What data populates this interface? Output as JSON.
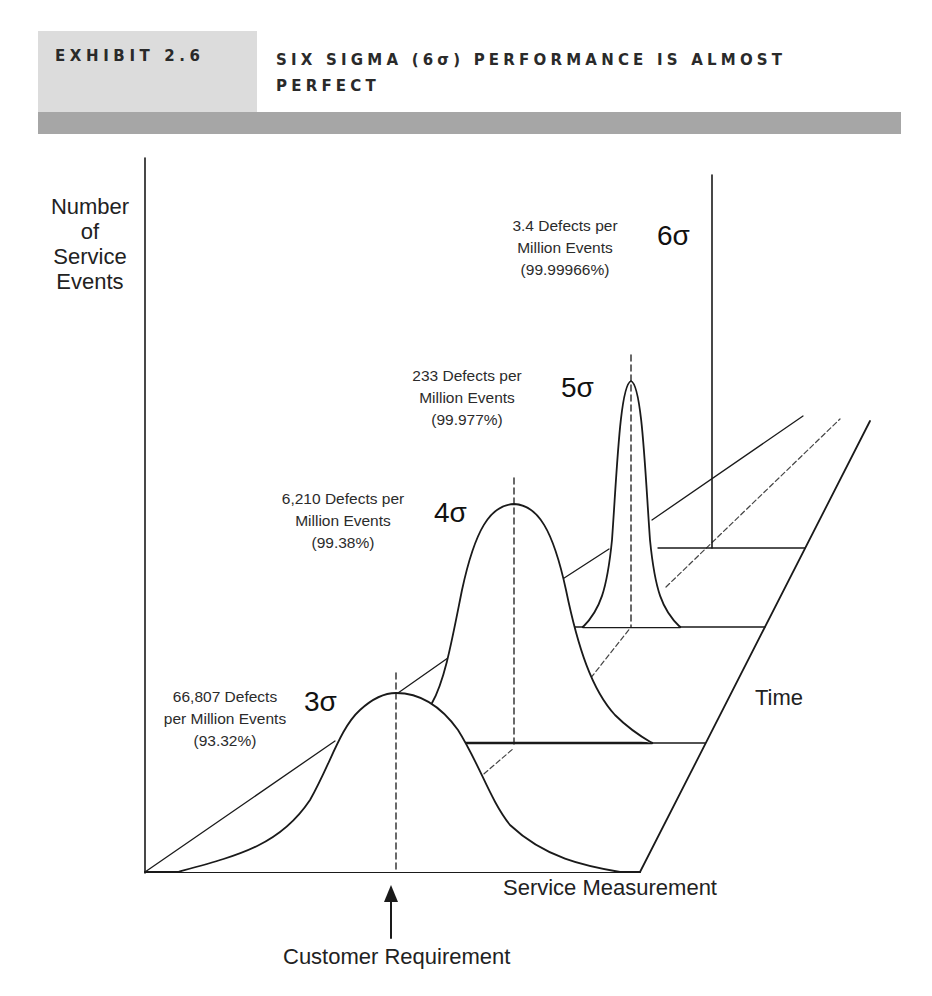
{
  "header": {
    "exhibit_label": "EXHIBIT 2.6",
    "title": "SIX SIGMA (6σ) PERFORMANCE IS ALMOST PERFECT"
  },
  "axes": {
    "y_label_lines": [
      "Number",
      "of",
      "Service",
      "Events"
    ],
    "x_label": "Service Measurement",
    "depth_label": "Time",
    "target_label": "Customer Requirement"
  },
  "curves": [
    {
      "sigma": "3σ",
      "line1": "66,807 Defects",
      "line2": "per Million Events",
      "line3": "(93.32%)"
    },
    {
      "sigma": "4σ",
      "line1": "6,210 Defects per",
      "line2": "Million Events",
      "line3": "(99.38%)"
    },
    {
      "sigma": "5σ",
      "line1": "233 Defects per",
      "line2": "Million Events",
      "line3": "(99.977%)"
    },
    {
      "sigma": "6σ",
      "line1": "3.4 Defects per",
      "line2": "Million Events",
      "line3": "(99.99966%)"
    }
  ],
  "colors": {
    "line": "#1a1a1a",
    "header_box": "#dcdcdc",
    "header_band": "#a6a6a6"
  }
}
